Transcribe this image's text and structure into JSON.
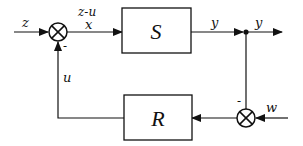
{
  "diagram": {
    "type": "feedback-control-block-diagram",
    "blocks": [
      {
        "id": "S",
        "label": "S"
      },
      {
        "id": "R",
        "label": "R"
      }
    ],
    "signals": {
      "input_z": "z",
      "error_top": "z-u",
      "error_x": "x",
      "output_y_left": "y",
      "output_y_right": "y",
      "feedback_u": "u",
      "disturbance_w": "w"
    },
    "summing_junctions": [
      {
        "id": "sum-top",
        "minus_sign": "-"
      },
      {
        "id": "sum-bottom",
        "minus_sign": "-"
      }
    ]
  }
}
